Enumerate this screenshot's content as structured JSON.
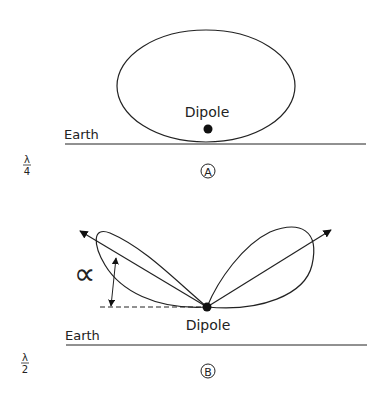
{
  "figure_a": {
    "dipole_label": "Dipole",
    "earth_label": "Earth",
    "height_numerator": "λ",
    "height_denominator": "4",
    "panel_label": "A"
  },
  "figure_b": {
    "dipole_label": "Dipole",
    "earth_label": "Earth",
    "angle_label": "∝",
    "height_numerator": "λ",
    "height_denominator": "2",
    "panel_label": "B"
  },
  "colors": {
    "stroke": "#222222",
    "background": "#ffffff"
  }
}
